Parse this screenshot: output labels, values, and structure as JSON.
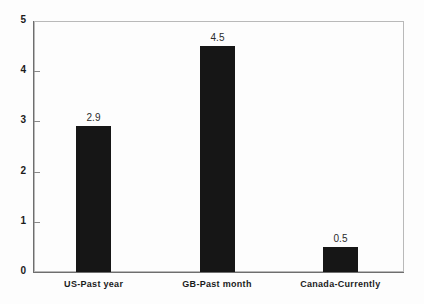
{
  "chart_data": {
    "type": "bar",
    "title": "",
    "subtitle": "",
    "xlabel": "",
    "ylabel": "",
    "categories": [
      "US-Past year",
      "GB-Past month",
      "Canada-Currently"
    ],
    "values": [
      2.9,
      4.5,
      0.5
    ],
    "value_labels": [
      "2.9",
      "4.5",
      "0.5"
    ],
    "ylim": [
      0,
      5
    ],
    "yticks": [
      "0",
      "1",
      "2",
      "3",
      "4",
      "5"
    ],
    "ytick_values": [
      0,
      1,
      2,
      3,
      4,
      5
    ],
    "grid": false,
    "legend": false,
    "legend_position": "none",
    "bar_color": "#161616",
    "axis_color": "#6e6e6e",
    "frame_color": "#b9b9b9",
    "background_color": "#fdfdfd",
    "text_color": "#1b1b1b"
  }
}
